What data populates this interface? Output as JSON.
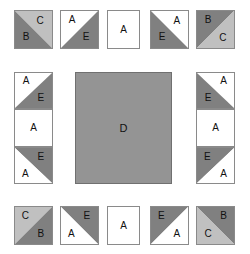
{
  "diagram": {
    "canvas": {
      "width": 250,
      "height": 254,
      "background": "#ffffff"
    },
    "palette": {
      "fabric_a_white": "#ffffff",
      "fabric_b_dark_gray": "#808080",
      "fabric_c_light_gray": "#c0c0c0",
      "fabric_d_medium_gray": "#949494",
      "fabric_e_dark_gray": "#808080",
      "outline": "#8a8a8a",
      "center_outline": "#707070",
      "label_color": "#111111"
    },
    "legend_letters": [
      "A",
      "B",
      "C",
      "D",
      "E"
    ],
    "center": {
      "label": "D",
      "fill": "#949494",
      "x": 75,
      "y": 72,
      "width": 97,
      "height": 112
    },
    "units": [
      {
        "name": "top-left-corner-unit",
        "x": 14,
        "y": 10,
        "width": 39,
        "height": 39,
        "halves": [
          {
            "shape": "tr",
            "fill": "#c0c0c0",
            "label": "C",
            "lx": 68,
            "ly": 26
          },
          {
            "shape": "bl",
            "fill": "#808080",
            "label": "B",
            "lx": 30,
            "ly": 70
          }
        ]
      },
      {
        "name": "top-row-unit-2",
        "x": 60,
        "y": 10,
        "width": 39,
        "height": 39,
        "halves": [
          {
            "shape": "tl",
            "fill": "#ffffff",
            "label": "A",
            "lx": 30,
            "ly": 24
          },
          {
            "shape": "br",
            "fill": "#808080",
            "label": "E",
            "lx": 68,
            "ly": 70
          }
        ]
      },
      {
        "name": "top-row-unit-3-plain",
        "x": 107,
        "y": 10,
        "width": 33,
        "height": 39,
        "halves": [
          {
            "shape": "full",
            "fill": "#ffffff",
            "label": "A",
            "lx": 50,
            "ly": 50
          }
        ]
      },
      {
        "name": "top-row-unit-4",
        "x": 150,
        "y": 10,
        "width": 39,
        "height": 39,
        "halves": [
          {
            "shape": "tr",
            "fill": "#ffffff",
            "label": "A",
            "lx": 70,
            "ly": 26
          },
          {
            "shape": "bl",
            "fill": "#808080",
            "label": "E",
            "lx": 30,
            "ly": 70
          }
        ]
      },
      {
        "name": "top-right-corner-unit",
        "x": 196,
        "y": 10,
        "width": 39,
        "height": 39,
        "halves": [
          {
            "shape": "tl",
            "fill": "#808080",
            "label": "B",
            "lx": 30,
            "ly": 24
          },
          {
            "shape": "br",
            "fill": "#c0c0c0",
            "label": "C",
            "lx": 70,
            "ly": 72
          }
        ]
      },
      {
        "name": "left-column-unit-top",
        "x": 14,
        "y": 72,
        "width": 39,
        "height": 37,
        "halves": [
          {
            "shape": "tl",
            "fill": "#ffffff",
            "label": "A",
            "lx": 30,
            "ly": 24
          },
          {
            "shape": "br",
            "fill": "#808080",
            "label": "E",
            "lx": 70,
            "ly": 72
          }
        ]
      },
      {
        "name": "left-column-unit-middle-plain",
        "x": 14,
        "y": 109,
        "width": 39,
        "height": 38,
        "halves": [
          {
            "shape": "full",
            "fill": "#ffffff",
            "label": "A",
            "lx": 50,
            "ly": 50
          }
        ]
      },
      {
        "name": "left-column-unit-bottom",
        "x": 14,
        "y": 147,
        "width": 39,
        "height": 37,
        "halves": [
          {
            "shape": "tr",
            "fill": "#808080",
            "label": "E",
            "lx": 70,
            "ly": 26
          },
          {
            "shape": "bl",
            "fill": "#ffffff",
            "label": "A",
            "lx": 28,
            "ly": 74
          }
        ]
      },
      {
        "name": "right-column-unit-top",
        "x": 196,
        "y": 72,
        "width": 39,
        "height": 37,
        "halves": [
          {
            "shape": "tr",
            "fill": "#ffffff",
            "label": "A",
            "lx": 72,
            "ly": 24
          },
          {
            "shape": "bl",
            "fill": "#808080",
            "label": "E",
            "lx": 30,
            "ly": 72
          }
        ]
      },
      {
        "name": "right-column-unit-middle-plain",
        "x": 196,
        "y": 109,
        "width": 39,
        "height": 38,
        "halves": [
          {
            "shape": "full",
            "fill": "#ffffff",
            "label": "A",
            "lx": 50,
            "ly": 50
          }
        ]
      },
      {
        "name": "right-column-unit-bottom",
        "x": 196,
        "y": 147,
        "width": 39,
        "height": 37,
        "halves": [
          {
            "shape": "tl",
            "fill": "#808080",
            "label": "E",
            "lx": 28,
            "ly": 26
          },
          {
            "shape": "br",
            "fill": "#ffffff",
            "label": "A",
            "lx": 72,
            "ly": 74
          }
        ]
      },
      {
        "name": "bottom-left-corner-unit",
        "x": 14,
        "y": 206,
        "width": 39,
        "height": 39,
        "halves": [
          {
            "shape": "tl",
            "fill": "#c0c0c0",
            "label": "C",
            "lx": 28,
            "ly": 24
          },
          {
            "shape": "br",
            "fill": "#808080",
            "label": "B",
            "lx": 70,
            "ly": 72
          }
        ]
      },
      {
        "name": "bottom-row-unit-2",
        "x": 60,
        "y": 206,
        "width": 39,
        "height": 39,
        "halves": [
          {
            "shape": "tr",
            "fill": "#808080",
            "label": "E",
            "lx": 70,
            "ly": 24
          },
          {
            "shape": "bl",
            "fill": "#ffffff",
            "label": "A",
            "lx": 28,
            "ly": 72
          }
        ]
      },
      {
        "name": "bottom-row-unit-3-plain",
        "x": 107,
        "y": 206,
        "width": 33,
        "height": 39,
        "halves": [
          {
            "shape": "full",
            "fill": "#ffffff",
            "label": "A",
            "lx": 50,
            "ly": 50
          }
        ]
      },
      {
        "name": "bottom-row-unit-4",
        "x": 150,
        "y": 206,
        "width": 39,
        "height": 39,
        "halves": [
          {
            "shape": "tl",
            "fill": "#808080",
            "label": "E",
            "lx": 28,
            "ly": 24
          },
          {
            "shape": "br",
            "fill": "#ffffff",
            "label": "A",
            "lx": 70,
            "ly": 74
          }
        ]
      },
      {
        "name": "bottom-right-corner-unit",
        "x": 196,
        "y": 206,
        "width": 39,
        "height": 39,
        "halves": [
          {
            "shape": "tr",
            "fill": "#808080",
            "label": "B",
            "lx": 72,
            "ly": 24
          },
          {
            "shape": "bl",
            "fill": "#c0c0c0",
            "label": "C",
            "lx": 30,
            "ly": 72
          }
        ]
      }
    ]
  }
}
